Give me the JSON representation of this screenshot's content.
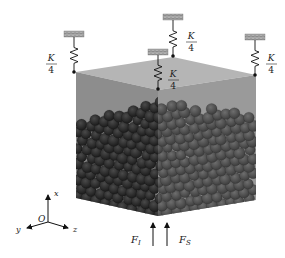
{
  "diagram": {
    "springs": [
      {
        "id": "left",
        "label_num": "K",
        "label_den": "4"
      },
      {
        "id": "back",
        "label_num": "K",
        "label_den": "4"
      },
      {
        "id": "front",
        "label_num": "K",
        "label_den": "4"
      },
      {
        "id": "right",
        "label_num": "K",
        "label_den": "4"
      }
    ],
    "forces": [
      {
        "id": "F_I",
        "label": "F",
        "subscript": "I"
      },
      {
        "id": "F_S",
        "label": "F",
        "subscript": "S"
      }
    ],
    "axes": {
      "origin": "O",
      "x": "x",
      "y": "y",
      "z": "z"
    },
    "colors": {
      "box_left_face": "#8a8a8a",
      "box_right_face": "#959595",
      "box_top_face": "#b5b5b5",
      "particles_left": "#2e2e2e",
      "particles_right": "#555555",
      "wall_hatch": "#8a8a8a"
    }
  }
}
